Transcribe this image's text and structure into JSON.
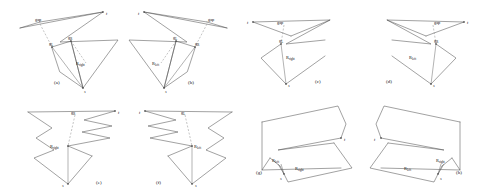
{
  "figure": {
    "background": "#ffffff",
    "stroke_color": "#555555",
    "dash_color": "#8a8a8a",
    "panel_count": 8
  },
  "labels": {
    "t": "t",
    "s": "s",
    "gap": "gap",
    "gL": "g",
    "gL_sub": "L",
    "gR": "g",
    "gR_sub": "R",
    "Rleft": "R",
    "Rleft_sub": "left",
    "Rright": "R",
    "Rright_sub": "right"
  },
  "panels": [
    {
      "id": "a",
      "caption": "(a)",
      "labels": [
        "gap",
        "gL",
        "gR",
        "Rright",
        "t",
        "s"
      ]
    },
    {
      "id": "b",
      "caption": "(b)",
      "labels": [
        "gap",
        "gL",
        "gR",
        "Rleft",
        "t",
        "s"
      ]
    },
    {
      "id": "c",
      "caption": "(c)",
      "labels": [
        "gap",
        "gL",
        "Rright",
        "t",
        "s"
      ]
    },
    {
      "id": "d",
      "caption": "(d)",
      "labels": [
        "gap",
        "gR",
        "Rleft",
        "t",
        "s"
      ]
    },
    {
      "id": "e",
      "caption": "(e)",
      "labels": [
        "gR",
        "Rright",
        "t",
        "s"
      ]
    },
    {
      "id": "f",
      "caption": "(f)",
      "labels": [
        "gL",
        "Rleft",
        "t",
        "s"
      ]
    },
    {
      "id": "g",
      "caption": "(g)",
      "labels": [
        "Rleft",
        "Rright",
        "t",
        "s"
      ]
    },
    {
      "id": "h",
      "caption": "(h)",
      "labels": [
        "Rleft",
        "Rright",
        "t",
        "s"
      ]
    }
  ]
}
